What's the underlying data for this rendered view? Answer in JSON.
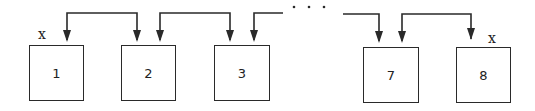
{
  "diagram": {
    "type": "linked-list-of-boxes",
    "colors": {
      "stroke": "#2a2a2a",
      "background": "#ffffff",
      "text": "#222222"
    },
    "nodes": [
      {
        "id": "1",
        "label": "1",
        "marker": "x"
      },
      {
        "id": "2",
        "label": "2",
        "marker": ""
      },
      {
        "id": "3",
        "label": "3",
        "marker": ""
      },
      {
        "id": "7",
        "label": "7",
        "marker": ""
      },
      {
        "id": "8",
        "label": "8",
        "marker": "x"
      }
    ],
    "ellipsis": "· · ·",
    "edges": [
      {
        "from": "1",
        "to": "2",
        "style": "bidirectional-bracket"
      },
      {
        "from": "2",
        "to": "3",
        "style": "bidirectional-bracket"
      },
      {
        "from": "3",
        "to": "...",
        "style": "incoming-from-right"
      },
      {
        "from": "...",
        "to": "7",
        "style": "incoming-from-left"
      },
      {
        "from": "7",
        "to": "8",
        "style": "bidirectional-bracket"
      }
    ],
    "markers": {
      "left": "x",
      "right": "x"
    }
  }
}
